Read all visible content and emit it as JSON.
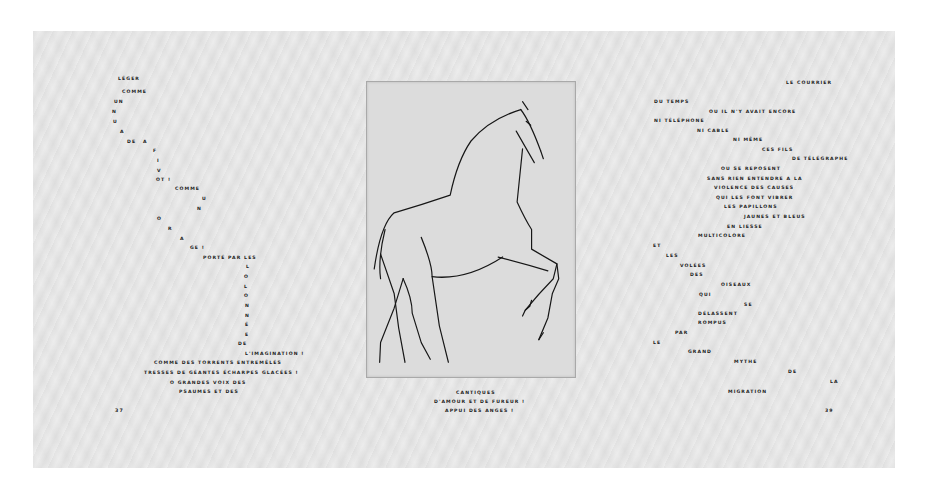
{
  "left_page": {
    "words": [
      {
        "t": "LÉGER",
        "x": 118,
        "y": 79
      },
      {
        "t": "COMME",
        "x": 122,
        "y": 92
      },
      {
        "t": "UN",
        "x": 114,
        "y": 102
      },
      {
        "t": "N",
        "x": 112,
        "y": 112
      },
      {
        "t": "U",
        "x": 113,
        "y": 122
      },
      {
        "t": "A",
        "x": 120,
        "y": 132
      },
      {
        "t": "DE",
        "x": 127,
        "y": 142
      },
      {
        "t": "A",
        "x": 143,
        "y": 142
      },
      {
        "t": "F",
        "x": 153,
        "y": 151
      },
      {
        "t": "I",
        "x": 157,
        "y": 161
      },
      {
        "t": "V",
        "x": 157,
        "y": 171
      },
      {
        "t": "OT !",
        "x": 156,
        "y": 180
      },
      {
        "t": "COMME",
        "x": 175,
        "y": 189
      },
      {
        "t": "U",
        "x": 202,
        "y": 199
      },
      {
        "t": "N",
        "x": 197,
        "y": 209
      },
      {
        "t": "O",
        "x": 157,
        "y": 219
      },
      {
        "t": "R",
        "x": 168,
        "y": 229
      },
      {
        "t": "A",
        "x": 180,
        "y": 239
      },
      {
        "t": "GE !",
        "x": 190,
        "y": 248
      },
      {
        "t": "PORTÉ PAR LES",
        "x": 203,
        "y": 258
      },
      {
        "t": "L",
        "x": 246,
        "y": 267
      },
      {
        "t": "O",
        "x": 244,
        "y": 277
      },
      {
        "t": "L",
        "x": 244,
        "y": 287
      },
      {
        "t": "O",
        "x": 244,
        "y": 296
      },
      {
        "t": "N",
        "x": 245,
        "y": 306
      },
      {
        "t": "N",
        "x": 245,
        "y": 316
      },
      {
        "t": "É",
        "x": 245,
        "y": 325
      },
      {
        "t": "E",
        "x": 245,
        "y": 335
      },
      {
        "t": "DE",
        "x": 238,
        "y": 344
      },
      {
        "t": "L'IMAGINATION !",
        "x": 245,
        "y": 354
      },
      {
        "t": "COMME DES TORRENTS ENTREMÊLÉS",
        "x": 154,
        "y": 363
      },
      {
        "t": "TRESSES DE GÉANTES ÉCHARPES GLACÉES !",
        "x": 144,
        "y": 373
      },
      {
        "t": "O GRANDES VOIX DES",
        "x": 170,
        "y": 383
      },
      {
        "t": "PSAUMES ET DES",
        "x": 179,
        "y": 392
      }
    ],
    "folio": {
      "t": "37",
      "x": 115,
      "y": 411
    }
  },
  "center_page": {
    "plate_caption": "etching-horse",
    "caption_lines": [
      {
        "t": "CANTIQUES",
        "x": 456,
        "y": 393
      },
      {
        "t": "D'AMOUR ET DE FUREUR !",
        "x": 434,
        "y": 402
      },
      {
        "t": "APPUI DES ANGES !",
        "x": 445,
        "y": 411
      }
    ]
  },
  "right_page": {
    "words": [
      {
        "t": "LE COURRIER",
        "x": 786,
        "y": 83
      },
      {
        "t": "DU TEMPS",
        "x": 654,
        "y": 102
      },
      {
        "t": "OU IL N'Y AVAIT ENCORE",
        "x": 709,
        "y": 112
      },
      {
        "t": "NI TÉLÉPHONE",
        "x": 654,
        "y": 121
      },
      {
        "t": "NI CABLE",
        "x": 697,
        "y": 131
      },
      {
        "t": "NI MÊME",
        "x": 733,
        "y": 140
      },
      {
        "t": "CES FILS",
        "x": 762,
        "y": 150
      },
      {
        "t": "DE TÉLÉGRAPHE",
        "x": 792,
        "y": 159
      },
      {
        "t": "OU SE REPOSENT",
        "x": 721,
        "y": 169
      },
      {
        "t": "SANS RIEN ENTENDRE A LA",
        "x": 707,
        "y": 179
      },
      {
        "t": "VIOLENCE DES CAUSES",
        "x": 714,
        "y": 188
      },
      {
        "t": "QUI LES FONT VIBRER",
        "x": 716,
        "y": 198
      },
      {
        "t": "LES PAPILLONS",
        "x": 724,
        "y": 207
      },
      {
        "t": "JAUNES ET BLEUS",
        "x": 744,
        "y": 217
      },
      {
        "t": "EN LIESSE",
        "x": 727,
        "y": 227
      },
      {
        "t": "MULTICOLORE",
        "x": 698,
        "y": 236
      },
      {
        "t": "ET",
        "x": 653,
        "y": 246
      },
      {
        "t": "LES",
        "x": 666,
        "y": 256
      },
      {
        "t": "VOLÉES",
        "x": 680,
        "y": 266
      },
      {
        "t": "DES",
        "x": 690,
        "y": 275
      },
      {
        "t": "OISEAUX",
        "x": 721,
        "y": 285
      },
      {
        "t": "QUI",
        "x": 699,
        "y": 295
      },
      {
        "t": "SE",
        "x": 744,
        "y": 305
      },
      {
        "t": "DÉLASSENT",
        "x": 698,
        "y": 314
      },
      {
        "t": "ROMPUS",
        "x": 698,
        "y": 323
      },
      {
        "t": "PAR",
        "x": 675,
        "y": 333
      },
      {
        "t": "LE",
        "x": 653,
        "y": 343
      },
      {
        "t": "GRAND",
        "x": 688,
        "y": 352
      },
      {
        "t": "MYTHE",
        "x": 734,
        "y": 362
      },
      {
        "t": "DE",
        "x": 788,
        "y": 372
      },
      {
        "t": "LA",
        "x": 830,
        "y": 382
      },
      {
        "t": "MIGRATION",
        "x": 728,
        "y": 392
      },
      {
        "t": "39",
        "x": 825,
        "y": 411
      }
    ]
  },
  "colors": {
    "background": "#ffffff",
    "paper": "#ececec",
    "plate": "#dcdcdc",
    "ink": "#1a1a1a"
  }
}
